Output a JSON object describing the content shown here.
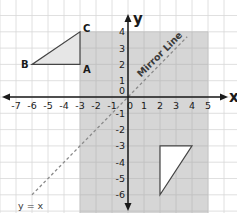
{
  "diagram": {
    "type": "coordinate-grid-reflection",
    "axes": {
      "x_label": "x",
      "y_label": "y",
      "x_ticks": [
        "-7",
        "-6",
        "-5",
        "-4",
        "-3",
        "-2",
        "-1",
        "0",
        "1",
        "2",
        "3",
        "4",
        "5"
      ],
      "y_ticks": [
        "4",
        "3",
        "2",
        "1",
        "0",
        "-1",
        "-2",
        "-3",
        "-4",
        "-5",
        "-6"
      ]
    },
    "shaded_region": {
      "x_min": -3,
      "x_max": 5,
      "y_min": -7,
      "y_max": 4,
      "color": "#cfcfcf"
    },
    "mirror_line": {
      "label": "Mirror Line",
      "equation_label": "y = x",
      "from": [
        -6,
        -6
      ],
      "to": [
        3.7,
        3.7
      ]
    },
    "object_triangle": {
      "vertices": [
        {
          "label": "A",
          "x": -3,
          "y": 2
        },
        {
          "label": "B",
          "x": -6,
          "y": 2
        },
        {
          "label": "C",
          "x": -3,
          "y": 4
        }
      ],
      "fill": "#e6e6e6"
    },
    "image_triangle": {
      "vertices": [
        {
          "x": 2,
          "y": -3
        },
        {
          "x": 4,
          "y": -3
        },
        {
          "x": 2,
          "y": -6
        }
      ],
      "fill": "#ffffff"
    },
    "colors": {
      "grid": "#d8d8d8",
      "axis": "#1a1a1a",
      "dashed": "#8a8a8a"
    }
  }
}
